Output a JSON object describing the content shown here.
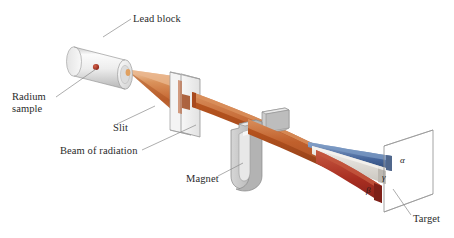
{
  "figure": {
    "background_color": "#ffffff"
  },
  "labels": {
    "lead_block": "Lead block",
    "radium_sample": "Radium",
    "radium_sample_line2": "sample",
    "slit": "Slit",
    "beam_of_radiation": "Beam of radiation",
    "magnet": "Magnet",
    "target": "Target"
  },
  "ray_labels": {
    "alpha": "α",
    "beta": "β",
    "gamma": "γ"
  },
  "colors": {
    "beam_orange_light": "#e8a878",
    "beam_orange": "#c4622c",
    "beam_orange_dark": "#9b4a21",
    "alpha_blue": "#3a5a8c",
    "alpha_blue_light": "#6f8fbe",
    "beta_red": "#b03024",
    "beta_red_dark": "#7e2018",
    "gamma_gray": "#d8d5d0",
    "gamma_gray_dark": "#a8a49e",
    "metal_light": "#efefef",
    "metal_mid": "#cfcfcf",
    "metal_dark": "#a6a6a6",
    "radium_dot": "#b03024",
    "outline": "#9a9a9a",
    "text": "#2b2b2b"
  },
  "components": {
    "lead_block_shape": "cylinder",
    "slit_shape": "vertical-plate-with-aperture",
    "magnet_shape": "horseshoe-u-magnet",
    "target_shape": "rectangular-screen",
    "radium_sample_shape": "dot"
  }
}
